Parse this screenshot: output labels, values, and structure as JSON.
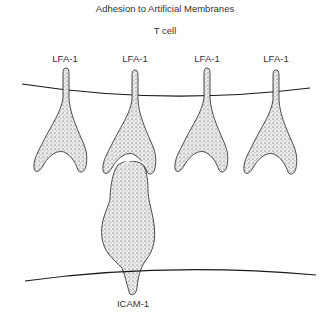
{
  "figure": {
    "title": "Adhesion to Artificial Membranes",
    "cell_label": "T cell",
    "molecules_top": [
      {
        "label": "LFA-1",
        "x": 65
      },
      {
        "label": "LFA-1",
        "x": 135
      },
      {
        "label": "LFA-1",
        "x": 207
      },
      {
        "label": "LFA-1",
        "x": 276
      }
    ],
    "molecule_bottom": {
      "label": "ICAM-1",
      "x": 133
    },
    "colors": {
      "line": "#1a1a1a",
      "stipple": "#3a3a3a",
      "fill": "#e8e8e8"
    }
  }
}
